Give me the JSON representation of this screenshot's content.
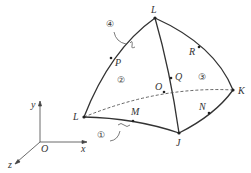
{
  "diagram": {
    "type": "curved-surface-element",
    "colors": {
      "stroke": "#333333",
      "background": "#ffffff"
    },
    "nodes": [
      {
        "id": "L_top",
        "label": "L",
        "x": 155,
        "y": 18
      },
      {
        "id": "L_left",
        "label": "L",
        "x": 84,
        "y": 117
      },
      {
        "id": "J",
        "label": "J",
        "x": 179,
        "y": 133
      },
      {
        "id": "K",
        "label": "K",
        "x": 233,
        "y": 90
      },
      {
        "id": "P",
        "label": "P",
        "x": 111,
        "y": 58
      },
      {
        "id": "R",
        "label": "R",
        "x": 199,
        "y": 47
      },
      {
        "id": "Q",
        "label": "Q",
        "x": 171,
        "y": 78
      },
      {
        "id": "O",
        "label": "O",
        "x": 164,
        "y": 92
      },
      {
        "id": "M",
        "label": "M",
        "x": 133,
        "y": 121
      },
      {
        "id": "N",
        "label": "N",
        "x": 209,
        "y": 113
      }
    ],
    "regions": [
      {
        "label": "①",
        "x": 102,
        "y": 136
      },
      {
        "label": "②",
        "x": 122,
        "y": 81
      },
      {
        "label": "③",
        "x": 203,
        "y": 78
      },
      {
        "label": "④",
        "x": 111,
        "y": 25
      }
    ],
    "axes": {
      "origin_label": "O",
      "x_label": "x",
      "y_label": "y",
      "z_label": "z"
    }
  }
}
